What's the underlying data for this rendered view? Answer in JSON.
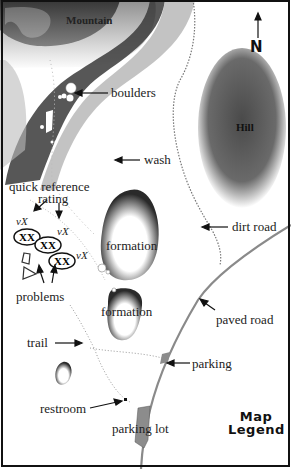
{
  "map": {
    "title_line1": "Map",
    "title_line2": "Legend",
    "north": "N",
    "features": {
      "mountain": "Mountain",
      "hill": "Hill",
      "boulders": "boulders",
      "wash": "wash",
      "dirt_road": "dirt road",
      "formation_1": "formation",
      "formation_2": "formation",
      "paved_road": "paved road",
      "parking": "parking",
      "trail": "trail",
      "restroom": "restroom",
      "parking_lot": "parking lot",
      "problems": "problems"
    },
    "quick_reference": {
      "line1": "quick reference",
      "line2": "rating",
      "badges": [
        "XX",
        "XX",
        "XX"
      ],
      "grades": [
        "vX",
        "vX",
        "vX"
      ]
    },
    "colors": {
      "terrain_dark": "#3a3a3a",
      "hill": "#555555",
      "road": "#8a8a8a",
      "parking_fill": "#8c8c8c",
      "border": "#111111"
    }
  }
}
